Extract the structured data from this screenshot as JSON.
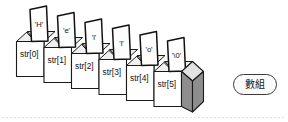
{
  "diagram": {
    "type": "isometric-array-boxes",
    "cell_count": 6,
    "cells": [
      {
        "index_label": "str[0]",
        "char_label": "'H'"
      },
      {
        "index_label": "str[1]",
        "char_label": "'e'"
      },
      {
        "index_label": "str[2]",
        "char_label": "'l'"
      },
      {
        "index_label": "str[3]",
        "char_label": "'l'"
      },
      {
        "index_label": "str[4]",
        "char_label": "'o'"
      },
      {
        "index_label": "str[5]",
        "char_label": "'\\0'"
      }
    ],
    "string_value": "Hello",
    "badge": {
      "label": "數組"
    },
    "colors": {
      "background": "#ffffff",
      "outline": "#1b1b1b",
      "box_front": "#ffffff",
      "box_inner_shade": "#d6d6d6",
      "end_cap": "#8e8e8e",
      "card": "#fdfdfd",
      "text": "#121212",
      "baseline_dots": "#d8d8d8",
      "badge_border": "#3a3a3a",
      "badge_fill": "#fbfbfb"
    }
  }
}
